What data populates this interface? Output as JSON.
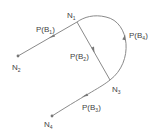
{
  "diagram": {
    "type": "directed-graph",
    "colors": {
      "line": "#8a8a8a",
      "text": "#444444",
      "node": "#777777",
      "background": "#ffffff"
    },
    "nodes": [
      {
        "id": "N1",
        "base": "N",
        "sub": "1",
        "x": 77,
        "y": 22
      },
      {
        "id": "N2",
        "base": "N",
        "sub": "2",
        "x": 18,
        "y": 56
      },
      {
        "id": "N3",
        "base": "N",
        "sub": "3",
        "x": 110,
        "y": 80
      },
      {
        "id": "N4",
        "base": "N",
        "sub": "4",
        "x": 52,
        "y": 116
      }
    ],
    "edges": [
      {
        "id": "B1",
        "label_base": "P(B",
        "label_sub": "1",
        "label_end": ")",
        "from": "N1",
        "to": "N2",
        "shape": "line"
      },
      {
        "id": "B2",
        "label_base": "P(B",
        "label_sub": "2",
        "label_end": ")",
        "from": "N1",
        "to": "N3",
        "shape": "line"
      },
      {
        "id": "B3",
        "label_base": "P(B",
        "label_sub": "3",
        "label_end": ")",
        "from": "N3",
        "to": "N4",
        "shape": "line"
      },
      {
        "id": "B4",
        "label_base": "P(B",
        "label_sub": "4",
        "label_end": ")",
        "from": "N3",
        "to": "N1",
        "shape": "arc"
      }
    ]
  }
}
